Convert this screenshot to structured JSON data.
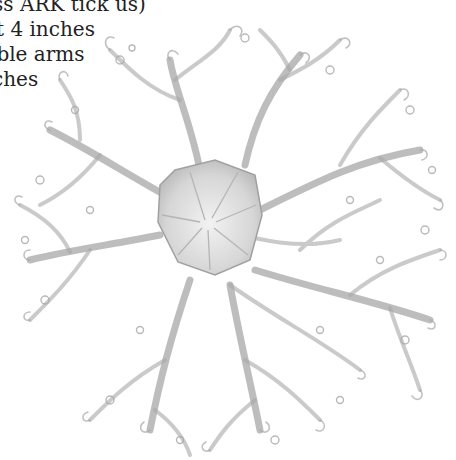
{
  "image": {
    "subject": "Pencil illustration of a basket star (Gorgonocephalus) with branching curling arms",
    "caption_lines": [
      "(luss ARK tick us)",
      "t 4 inches",
      "ible arms",
      "ches"
    ],
    "colors": {
      "background": "#ffffff",
      "ink": "#222222",
      "pencil": "#9a9a9a",
      "disc": "#d8d8d8"
    }
  }
}
